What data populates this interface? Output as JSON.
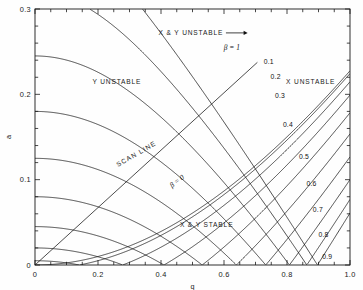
{
  "figure": {
    "type": "stability-diagram",
    "xlabel": "q",
    "ylabel": "a"
  },
  "chart_data": {
    "type": "line",
    "title": "",
    "xlabel": "q",
    "ylabel": "a",
    "xlim": [
      0,
      1.0
    ],
    "ylim": [
      0,
      0.3
    ],
    "grid": false,
    "legend": "none",
    "xticks_major": [
      "0",
      "0.2",
      "0.4",
      "0.6",
      "0.8",
      "1.0"
    ],
    "xticks_major_values": [
      0,
      0.2,
      0.4,
      0.6,
      0.8,
      1.0
    ],
    "xtick_minor_step": 0.05,
    "yticks_major": [
      "0",
      "0.1",
      "0.2",
      "0.3"
    ],
    "yticks_major_values": [
      0,
      0.1,
      0.2,
      0.3
    ],
    "ytick_minor_step": 0.02,
    "annotations": [
      {
        "name": "y-unstable",
        "text": "Y UNSTABLE",
        "q": 0.26,
        "a": 0.215
      },
      {
        "name": "x-unstable",
        "text": "X UNSTABLE",
        "q": 0.875,
        "a": 0.215
      },
      {
        "name": "xy-unstable",
        "text": "X & Y UNSTABLE",
        "q": 0.495,
        "a": 0.272,
        "arrow_to_q": 0.675
      },
      {
        "name": "xy-stable",
        "text": "X & Y STABLE",
        "q": 0.545,
        "a": 0.047
      },
      {
        "name": "scan-line",
        "text": "SCAN LINE",
        "q": 0.325,
        "a": 0.128,
        "rotated": true
      },
      {
        "name": "beta-zero",
        "text": "β = 0",
        "q": 0.455,
        "a": 0.096,
        "rotated": true
      },
      {
        "name": "beta-one",
        "text": "β = 1",
        "q": 0.625,
        "a": 0.252
      }
    ],
    "beta_y_labels": [
      "0.1",
      "0.2",
      "0.3",
      "0.4",
      "0.5",
      "0.6",
      "0.7",
      "0.8",
      "0.9"
    ],
    "beta_y_label_positions": [
      {
        "label": "0.1",
        "q": 0.726,
        "a": 0.2355
      },
      {
        "label": "0.2",
        "q": 0.748,
        "a": 0.2185
      },
      {
        "label": "0.3",
        "q": 0.762,
        "a": 0.1955
      },
      {
        "label": "0.4",
        "q": 0.787,
        "a": 0.1615
      },
      {
        "label": "0.5",
        "q": 0.838,
        "a": 0.1245
      },
      {
        "label": "0.6",
        "q": 0.862,
        "a": 0.0925
      },
      {
        "label": "0.7",
        "q": 0.882,
        "a": 0.062
      },
      {
        "label": "0.8",
        "q": 0.9,
        "a": 0.033
      },
      {
        "label": "0.9",
        "q": 0.912,
        "a": 0.0075
      }
    ],
    "beta_x_values": [
      0,
      0.1,
      0.2,
      0.3,
      0.4,
      0.5,
      0.6,
      0.7,
      0.8,
      0.9,
      1.0
    ],
    "beta_y_values": [
      0,
      0.1,
      0.2,
      0.3,
      0.4,
      0.5,
      0.6,
      0.7,
      0.8,
      0.9,
      1.0
    ],
    "scan_line": {
      "from_q": 0.0,
      "from_a": 0.0,
      "to_q": 0.706,
      "to_a": 0.2375
    },
    "apex": {
      "q": 0.706,
      "a": 0.2375
    }
  },
  "colors": {
    "curve": "#111111",
    "axis": "#1a1a1a",
    "background": "#ffffff"
  }
}
